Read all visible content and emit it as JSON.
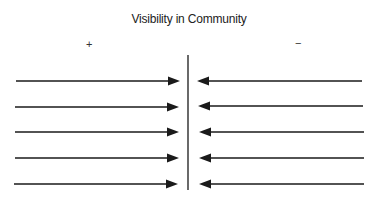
{
  "diagram": {
    "title": "Visibility in Community",
    "left_label": "+",
    "right_label": "−",
    "colors": {
      "line": "#1a1a1a",
      "background": "#ffffff"
    },
    "center_line": {
      "x": 188,
      "y1": 55,
      "y2": 190
    },
    "left_arrows": [
      {
        "x1": 16,
        "x2": 180,
        "y": 81
      },
      {
        "x1": 15,
        "x2": 179,
        "y": 107
      },
      {
        "x1": 15,
        "x2": 179,
        "y": 132
      },
      {
        "x1": 15,
        "x2": 179,
        "y": 158
      },
      {
        "x1": 14,
        "x2": 178,
        "y": 184
      }
    ],
    "right_arrows": [
      {
        "x1": 362,
        "x2": 197,
        "y": 81
      },
      {
        "x1": 363,
        "x2": 198,
        "y": 106
      },
      {
        "x1": 364,
        "x2": 199,
        "y": 132
      },
      {
        "x1": 364,
        "x2": 199,
        "y": 158
      },
      {
        "x1": 364,
        "x2": 199,
        "y": 184
      }
    ]
  }
}
